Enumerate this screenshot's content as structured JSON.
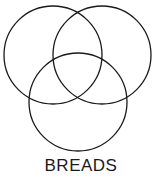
{
  "diagram": {
    "type": "venn",
    "label": "BREADS",
    "stroke_color": "#1a1a1a",
    "circles": [
      {
        "name": "top-left",
        "cx": 53,
        "cy": 55,
        "r": 49
      },
      {
        "name": "top-right",
        "cx": 102,
        "cy": 55,
        "r": 49
      },
      {
        "name": "bottom",
        "cx": 78,
        "cy": 102,
        "r": 49
      }
    ]
  }
}
